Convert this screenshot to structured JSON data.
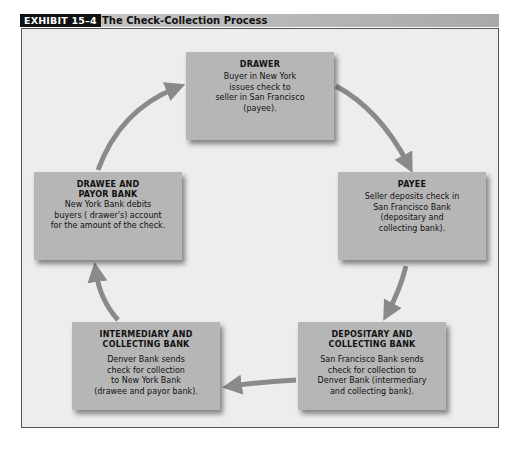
{
  "header": {
    "exhibit_label": "EXHIBIT 15–4",
    "title": "The Check-Collection Process"
  },
  "colors": {
    "box_fill": "#b6b6b6",
    "frame_bg": "#ededed",
    "arrow": "#8a8a8a",
    "label_bg": "#111111"
  },
  "nodes": [
    {
      "id": "drawer",
      "title": "DRAWER",
      "body": "Buyer in New York\nissues check to\nseller in San Francisco\n(payee)."
    },
    {
      "id": "payee",
      "title": "PAYEE",
      "body": "Seller deposits check in\nSan Francisco Bank\n(depositary and\ncollecting bank)."
    },
    {
      "id": "depositary",
      "title": "DEPOSITARY AND\nCOLLECTING BANK",
      "body": "San Francisco Bank sends\ncheck for collection to\nDenver Bank (intermediary\nand collecting bank)."
    },
    {
      "id": "intermediary",
      "title": "INTERMEDIARY AND\nCOLLECTING BANK",
      "body": "Denver Bank sends\ncheck for collection\nto New York Bank\n(drawee and payor bank)."
    },
    {
      "id": "drawee",
      "title": "DRAWEE AND\nPAYOR BANK",
      "body": "New York Bank debits\nbuyers ( drawer's) account\nfor the amount of the check."
    }
  ],
  "edges": [
    {
      "from": "drawer",
      "to": "payee"
    },
    {
      "from": "payee",
      "to": "depositary"
    },
    {
      "from": "depositary",
      "to": "intermediary"
    },
    {
      "from": "intermediary",
      "to": "drawee"
    },
    {
      "from": "drawee",
      "to": "drawer"
    }
  ]
}
